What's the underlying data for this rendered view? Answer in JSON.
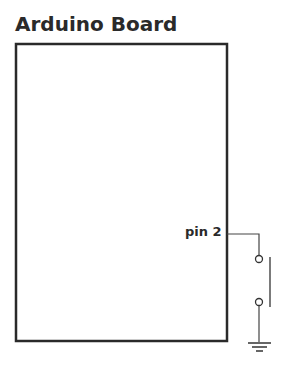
{
  "title": "Arduino Board",
  "pin": {
    "label": "pin 2"
  },
  "components": [
    "arduino-board",
    "pushbutton-switch",
    "ground"
  ],
  "colors": {
    "stroke": "#2a2a2a",
    "background": "#ffffff"
  }
}
